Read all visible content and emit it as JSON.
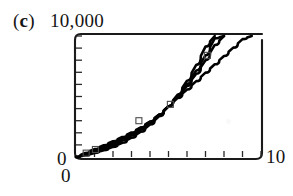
{
  "figure": {
    "panel_letter": "(c)",
    "panel_letter_prefix": "(",
    "panel_letter_core": "c",
    "panel_letter_suffix": ")"
  },
  "axes": {
    "y_max_label": "10,000",
    "y_min_label": "0",
    "x_min_label": "0",
    "x_max_label": "10",
    "x_tick_count": 10,
    "y_tick_count": 10
  },
  "colors": {
    "curve": "#000000",
    "frame": "#1a1a1a",
    "tick": "#2a2a2a",
    "marker": "#4a4a4a",
    "background": "#ffffff",
    "text": "#141414"
  },
  "chart_data": {
    "type": "line",
    "title": "(c)",
    "xlabel": "",
    "ylabel": "",
    "xlim": [
      0,
      10
    ],
    "ylim": [
      0,
      10000
    ],
    "x_ticks": [
      0,
      1,
      2,
      3,
      4,
      5,
      6,
      7,
      8,
      9,
      10
    ],
    "y_ticks": [
      0,
      1000,
      2000,
      3000,
      4000,
      5000,
      6000,
      7000,
      8000,
      9000,
      10000
    ],
    "x_tick_labels": [
      "0",
      "",
      "",
      "",
      "",
      "",
      "",
      "",
      "",
      "",
      "10"
    ],
    "y_tick_labels": [
      "0",
      "",
      "",
      "",
      "",
      "",
      "",
      "",
      "",
      "",
      "10,000"
    ],
    "grid": false,
    "legend": null,
    "legend_position": "none",
    "x": [
      0,
      0.5,
      1,
      1.5,
      2,
      2.5,
      3,
      3.5,
      4,
      4.5,
      5,
      5.5,
      6,
      6.5,
      7,
      7.5,
      8,
      8.5,
      9,
      9.5,
      10
    ],
    "series": [
      {
        "name": "curve-1",
        "values": [
          0,
          140,
          330,
          560,
          840,
          1180,
          1600,
          2090,
          2680,
          3380,
          4200,
          5170,
          6300,
          7610,
          9120,
          10000,
          null,
          null,
          null,
          null,
          null
        ]
      },
      {
        "name": "curve-2",
        "values": [
          0,
          190,
          420,
          690,
          1000,
          1360,
          1780,
          2260,
          2820,
          3460,
          4200,
          5060,
          6040,
          7150,
          8400,
          9810,
          10000,
          null,
          null,
          null,
          null
        ]
      },
      {
        "name": "curve-3",
        "values": [
          0,
          250,
          520,
          820,
          1150,
          1520,
          1930,
          2390,
          2910,
          3510,
          4200,
          4990,
          5880,
          6880,
          8000,
          9260,
          10000,
          null,
          null,
          null,
          null
        ]
      },
      {
        "name": "curve-4",
        "values": [
          0,
          330,
          650,
          970,
          1300,
          1650,
          2030,
          2450,
          2930,
          3500,
          4200,
          4890,
          5580,
          6270,
          6970,
          7660,
          8350,
          9040,
          9740,
          10000,
          null
        ]
      }
    ],
    "markers": [
      {
        "x": 0.55,
        "y": 320
      },
      {
        "x": 1.05,
        "y": 620
      },
      {
        "x": 3.4,
        "y": 3000
      },
      {
        "x": 5.1,
        "y": 4350
      },
      {
        "x": 7.1,
        "y": 8400
      }
    ]
  }
}
